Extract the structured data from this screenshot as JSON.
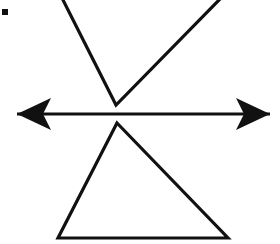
{
  "document": {
    "title": "Geometric line figure",
    "background_color": "#ffffff",
    "ink_color": "#0d0d0d",
    "width": 280,
    "height": 244,
    "description": "Black line drawing: a downward-pointing triangle cropped by the top edge, a horizontal double-headed arrow across the middle, and an upward-pointing triangle below."
  },
  "figure": {
    "stroke_color": "#111111",
    "stroke_width": 3.2,
    "elements": [
      {
        "name": "upper-inverted-triangle",
        "label": "Downward-pointing triangle (top, cropped)",
        "type": "open-polyline",
        "points": "62,-2 116,105 221,-2",
        "apex": {
          "x": 116,
          "y": 105
        },
        "cropped_edge": "top"
      },
      {
        "name": "horizontal-double-arrow",
        "label": "Horizontal double-headed arrow",
        "type": "arrow",
        "shaft_y": 114,
        "x_start": 17,
        "x_end": 270,
        "heads": "both",
        "head_style": "barbed",
        "head_length": 34,
        "head_half_width": 16,
        "barb_inset": 11
      },
      {
        "name": "lower-upright-triangle",
        "label": "Upward-pointing triangle (bottom)",
        "type": "closed-polygon",
        "points": "117,123 228,238 58,238",
        "apex": {
          "x": 117,
          "y": 123
        },
        "base_left": {
          "x": 58,
          "y": 238
        },
        "base_right": {
          "x": 228,
          "y": 238
        }
      },
      {
        "name": "corner-mark",
        "label": "Small black square mark",
        "type": "square",
        "x": 2,
        "y": 9,
        "size": 6
      }
    ]
  }
}
